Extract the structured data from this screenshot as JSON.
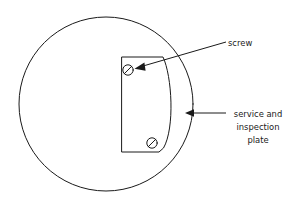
{
  "figure": {
    "name": "service-and-inspection-plate-diagram",
    "background_color": "#ffffff",
    "line_color": "#1a1a1a",
    "width": 296,
    "height": 206
  },
  "body_circle": {
    "name": "tank-body-outline",
    "cx": 106,
    "cy": 104,
    "r": 87
  },
  "plate": {
    "name": "service-and-inspection-plate",
    "left": 122,
    "top": 57,
    "right": 163,
    "bottom": 152,
    "arc_bulge_x": 175
  },
  "screws": [
    {
      "name": "screw-upper",
      "cx": 128,
      "cy": 70,
      "r": 5.2
    },
    {
      "name": "screw-lower",
      "cx": 152,
      "cy": 143,
      "r": 5.2
    }
  ],
  "callouts": {
    "screw": {
      "label": "screw",
      "text_x": 228,
      "text_y": 46,
      "leader_start_x": 226,
      "leader_start_y": 42,
      "leader_end_x": 141,
      "leader_end_y": 67
    },
    "plate": {
      "lines": [
        "service and",
        "inspection",
        "plate"
      ],
      "text_x": 258,
      "text_y": 117,
      "line_height": 13,
      "leader_start_x": 226,
      "leader_start_y": 113,
      "leader_end_x": 192,
      "leader_end_y": 113
    }
  }
}
